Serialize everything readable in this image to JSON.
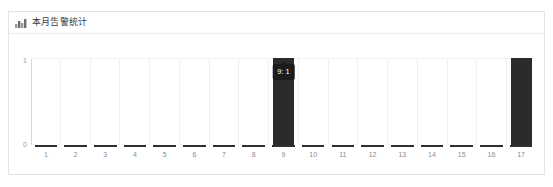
{
  "card": {
    "icon": "bar-chart-icon",
    "title": "本月告警统计"
  },
  "chart_data": {
    "type": "bar",
    "title": "本月告警统计",
    "xlabel": "",
    "ylabel": "",
    "categories": [
      "1",
      "2",
      "3",
      "4",
      "5",
      "6",
      "7",
      "8",
      "9",
      "10",
      "11",
      "12",
      "13",
      "14",
      "15",
      "16",
      "17"
    ],
    "values": [
      0,
      0,
      0,
      0,
      0,
      0,
      0,
      0,
      1,
      0,
      0,
      0,
      0,
      0,
      0,
      0,
      1
    ],
    "ylim": [
      0,
      1
    ],
    "ytick_labels": [
      "1",
      "0"
    ],
    "grid": true,
    "legend": "none",
    "bar_color": "#2b2b2b",
    "tooltip": {
      "visible": true,
      "category": "9",
      "text": "9: 1"
    }
  }
}
